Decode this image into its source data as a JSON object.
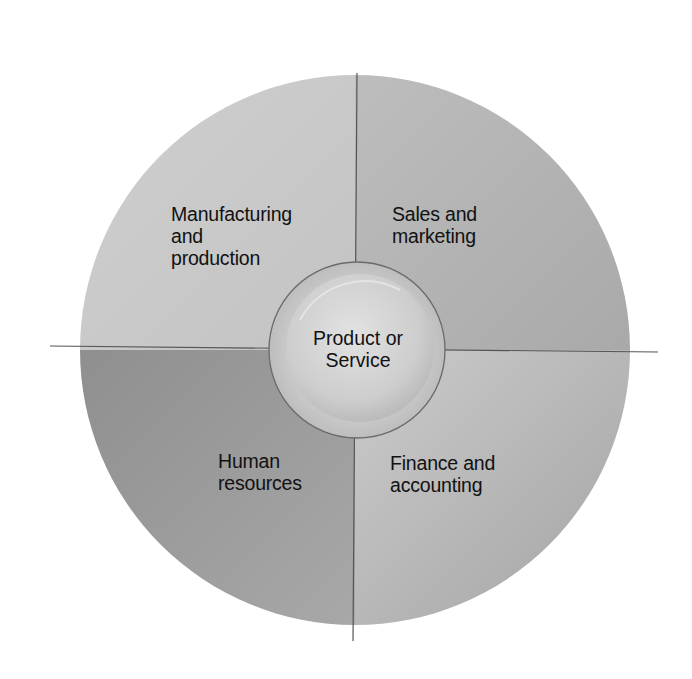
{
  "diagram": {
    "center": {
      "label": "Product or\nService"
    },
    "quadrants": [
      {
        "id": "top-left",
        "label": "Manufacturing\nand\nproduction",
        "color": "#c9c9c9"
      },
      {
        "id": "top-right",
        "label": "Sales and\nmarketing",
        "color": "#b8b8b8"
      },
      {
        "id": "bottom-left",
        "label": "Human\nresources",
        "color": "#9e9e9e"
      },
      {
        "id": "bottom-right",
        "label": "Finance and\naccounting",
        "color": "#c2c2c2"
      }
    ],
    "colors": {
      "background": "#ffffff",
      "axis_line": "#555555",
      "circle_outline": "#6a6a6a",
      "center_fill": "#d4d4d4"
    }
  }
}
